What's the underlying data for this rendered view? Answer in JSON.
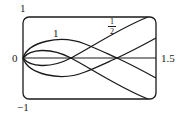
{
  "figure": {
    "type": "parametric-curve-family",
    "frame": {
      "x_range": [
        0,
        1.5
      ],
      "y_range": [
        -1,
        1
      ],
      "corners": "rounded"
    },
    "axis_labels": {
      "y_top": "1",
      "y_bottom": "−1",
      "x_left": "0",
      "x_right": "1.5"
    },
    "curve_labels": {
      "outer": "1",
      "inner_num": "1",
      "inner_den": "2"
    },
    "curves": [
      {
        "name": "parameter-1",
        "label": "1",
        "description": "wide lens crossing axis near x≈1.1, ending at right edge y≈±0.5"
      },
      {
        "name": "parameter-1/2",
        "label": "1/2",
        "description": "narrow lens crossing axis near x≈0.55, ending at frame corners y≈±1"
      }
    ],
    "colors": {
      "stroke": "#1a1a1a",
      "background": "#ffffff"
    }
  }
}
